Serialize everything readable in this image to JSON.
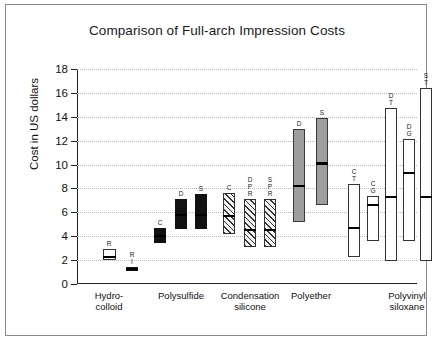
{
  "chart_data": {
    "type": "bar",
    "title": "Comparison of Full-arch Impression Costs",
    "xlabel": "",
    "ylabel": "Cost in US dollars",
    "ylim": [
      0,
      18
    ],
    "yticks": [
      0,
      2,
      4,
      6,
      8,
      10,
      12,
      14,
      16,
      18
    ],
    "grid": true,
    "legend": "none",
    "group_labels": [
      "Hydro-\ncolloid",
      "Polysulfide",
      "Condensation\nsilicone",
      "Polyether",
      "Polyvinyl siloxane"
    ],
    "groups": [
      {
        "name": "Hydrocolloid",
        "fill": "open",
        "bars": [
          {
            "code": "R",
            "low": 2.0,
            "high": 2.9,
            "median": 2.25
          },
          {
            "code": "R\nI",
            "low": 1.1,
            "high": 1.45,
            "median": 1.28,
            "fill": "solid"
          }
        ]
      },
      {
        "name": "Polysulfide",
        "fill": "solid",
        "bars": [
          {
            "code": "C",
            "low": 3.4,
            "high": 4.7,
            "median": 4.0
          },
          {
            "code": "D",
            "low": 4.6,
            "high": 7.1,
            "median": 5.8
          },
          {
            "code": "S",
            "low": 4.6,
            "high": 7.5,
            "median": 5.8
          }
        ]
      },
      {
        "name": "Condensation silicone",
        "fill": "hatch",
        "bars": [
          {
            "code": "C",
            "low": 4.2,
            "high": 7.6,
            "median": 5.7
          },
          {
            "code": "D\nP\nR",
            "low": 3.1,
            "high": 7.1,
            "median": 4.5
          },
          {
            "code": "S\nP\nR",
            "low": 3.1,
            "high": 7.1,
            "median": 4.5
          }
        ]
      },
      {
        "name": "Polyether",
        "fill": "gray",
        "bars": [
          {
            "code": "D",
            "low": 5.2,
            "high": 13.0,
            "median": 8.2
          },
          {
            "code": "S",
            "low": 6.6,
            "high": 13.9,
            "median": 10.1
          }
        ]
      },
      {
        "name": "Polyvinyl siloxane",
        "fill": "open",
        "bars": [
          {
            "code": "C\nT",
            "low": 2.3,
            "high": 8.4,
            "median": 4.7
          },
          {
            "code": "C\nG",
            "low": 3.6,
            "high": 7.4,
            "median": 6.6
          },
          {
            "code": "D\nT",
            "low": 1.9,
            "high": 14.7,
            "median": 7.3
          },
          {
            "code": "D\nG",
            "low": 3.6,
            "high": 12.1,
            "median": 9.3
          },
          {
            "code": "S\nT",
            "low": 1.9,
            "high": 16.4,
            "median": 7.3
          },
          {
            "code": "S\nG",
            "low": 4.0,
            "high": 12.6,
            "median": 10.3
          },
          {
            "code": "D\nT\nP\nR",
            "low": 2.2,
            "high": 9.7,
            "median": 5.5
          },
          {
            "code": "D\nG\nP\nR",
            "low": 2.6,
            "high": 8.9,
            "median": 7.0
          },
          {
            "code": "S\nT\nP\nR",
            "low": 2.2,
            "high": 10.6,
            "median": 5.8
          },
          {
            "code": "S\nG\nP\nR",
            "low": 2.6,
            "high": 8.9,
            "median": 6.7
          }
        ]
      }
    ],
    "bar_positions": {
      "comment": "x centers in px within 340px plot width, and bar pixel widths",
      "centers": [
        32,
        55,
        83,
        104,
        124,
        152,
        173,
        193,
        222,
        245,
        277,
        296,
        314,
        332,
        349,
        367,
        385,
        402,
        420,
        437
      ],
      "widths": [
        13,
        12,
        12,
        12,
        12,
        12,
        12,
        12,
        12,
        12,
        12,
        12,
        12,
        12,
        12,
        12,
        12,
        12,
        12,
        12
      ]
    },
    "group_label_x": [
      32,
      104,
      173,
      234,
      330
    ]
  }
}
